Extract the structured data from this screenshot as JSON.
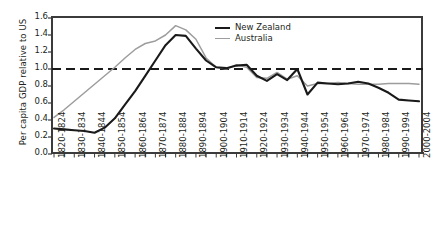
{
  "chart_data": {
    "type": "line",
    "title": "",
    "xlabel": "",
    "ylabel": "Per capita GDP relative to US",
    "ylim": [
      0.0,
      1.6
    ],
    "ytick_labels": [
      "1.6",
      "1.4",
      "1.2",
      "1.0",
      "0.8",
      "0.6",
      "0.4",
      "0.2",
      "0.0"
    ],
    "ytick_values": [
      1.6,
      1.4,
      1.2,
      1.0,
      0.8,
      0.6,
      0.4,
      0.2,
      0.0
    ],
    "grid": false,
    "legend_position": "top-center-right",
    "reference_line": {
      "value": 1.0,
      "style": "dashed",
      "color": "#1a1a1a"
    },
    "categories": [
      "1820-1824",
      "1825-1829",
      "1830-1834",
      "1835-1839",
      "1840-1844",
      "1845-1849",
      "1850-1854",
      "1855-1859",
      "1860-1864",
      "1865-1869",
      "1870-1874",
      "1875-1879",
      "1880-1884",
      "1885-1889",
      "1890-1894",
      "1895-1899",
      "1900-1904",
      "1905-1909",
      "1910-1914",
      "1915-1919",
      "1920-1924",
      "1925-1929",
      "1930-1934",
      "1935-1939",
      "1940-1944",
      "1945-1949",
      "1950-1954",
      "1955-1959",
      "1960-1964",
      "1965-1969",
      "1970-1974",
      "1975-1979",
      "1980-1984",
      "1985-1989",
      "1990-1994",
      "1995-1999",
      "2000-2004"
    ],
    "xtick_labels": [
      "1820-1824",
      "1830-1834",
      "1840-1844",
      "1850-1854",
      "1860-1864",
      "1870-1874",
      "1880-1884",
      "1890-1894",
      "1900-1904",
      "1910-1914",
      "1920-1924",
      "1930-1934",
      "1940-1944",
      "1950-1954",
      "1960-1964",
      "1970-1974",
      "1980-1984",
      "1990-1994",
      "2000-2004"
    ],
    "series": [
      {
        "name": "New Zealand",
        "color": "#1a1a1a",
        "values": [
          0.3,
          0.29,
          0.28,
          0.27,
          0.25,
          0.31,
          0.42,
          0.58,
          0.74,
          0.92,
          1.1,
          1.28,
          1.4,
          1.39,
          1.24,
          1.1,
          1.02,
          1.01,
          1.04,
          1.05,
          0.92,
          0.86,
          0.94,
          0.87,
          1.0,
          0.7,
          0.84,
          0.83,
          0.82,
          0.83,
          0.85,
          0.83,
          0.78,
          0.72,
          0.64,
          0.63,
          0.62
        ]
      },
      {
        "name": "Australia",
        "color": "#9d9d9d",
        "values": [
          0.43,
          0.52,
          0.62,
          0.72,
          0.82,
          0.92,
          1.02,
          1.13,
          1.23,
          1.3,
          1.33,
          1.4,
          1.51,
          1.46,
          1.35,
          1.13,
          1.02,
          1.0,
          1.05,
          1.02,
          0.9,
          0.89,
          0.96,
          0.88,
          0.92,
          0.8,
          0.83,
          0.83,
          0.84,
          0.83,
          0.82,
          0.82,
          0.82,
          0.83,
          0.83,
          0.83,
          0.82
        ]
      }
    ]
  },
  "legend": {
    "items": [
      {
        "label": "New Zealand"
      },
      {
        "label": "Australia"
      }
    ]
  }
}
